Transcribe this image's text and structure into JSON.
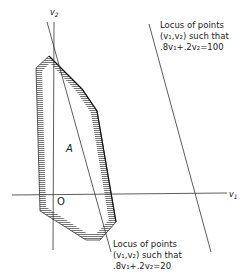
{
  "diagram": {
    "axes": {
      "horizontal_label_base": "v",
      "horizontal_label_sub": "1",
      "vertical_label_base": "v",
      "vertical_label_sub": "2",
      "origin_label": "O"
    },
    "region_label": "A",
    "annotations": [
      {
        "line1": "Locus of points",
        "line2": "(v₁,v₂)  such that",
        "line3": ".8v₁+.2v₂=100"
      },
      {
        "line1": "Locus of points",
        "line2": "(v₁,v₂)  such that",
        "line3": ".8v₁+.2v₂=20"
      }
    ],
    "colors": {
      "ink": "#222222",
      "hatch": "#777777"
    }
  }
}
